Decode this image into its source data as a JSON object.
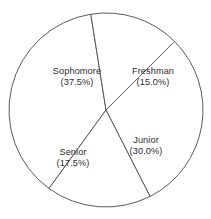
{
  "chart_data": {
    "type": "pie",
    "title": "",
    "subtitle": "",
    "xlabel": "",
    "ylabel": "",
    "legend": "none",
    "grid": false,
    "labels_inside": true,
    "categories": [
      "Sophomore",
      "Freshman",
      "Junior",
      "Senior"
    ],
    "values": [
      37.5,
      15.0,
      30.0,
      17.5
    ],
    "units": "percent",
    "total": 100.0,
    "slices": [
      {
        "name": "Sophomore",
        "value": 37.5,
        "percent_text": "(37.5%)",
        "label_line1": "Sophomore",
        "label_line2": "(37.5%)",
        "start_angle_deg": 99,
        "end_angle_deg": 234,
        "sweep_deg": 135,
        "label_x": 77,
        "label_y": 77
      },
      {
        "name": "Freshman",
        "value": 15.0,
        "percent_text": "(15.0%)",
        "label_line1": "Freshman",
        "label_line2": "(15.0%)",
        "start_angle_deg": 45,
        "end_angle_deg": 99,
        "sweep_deg": 54,
        "label_x": 153,
        "label_y": 77
      },
      {
        "name": "Junior",
        "value": 30.0,
        "percent_text": "(30.0%)",
        "label_line1": "Junior",
        "label_line2": "(30.0%)",
        "start_angle_deg": -63,
        "end_angle_deg": 45,
        "sweep_deg": 108,
        "label_x": 146,
        "label_y": 146
      },
      {
        "name": "Senior",
        "value": 17.5,
        "percent_text": "(17.5%)",
        "label_line1": "Senior",
        "label_line2": "(17.5%)",
        "start_angle_deg": -126,
        "end_angle_deg": -63,
        "sweep_deg": 63,
        "label_x": 73,
        "label_y": 158
      }
    ],
    "geometry": {
      "center_x": 106,
      "center_y": 110,
      "radius": 97
    },
    "style": {
      "background": "#ffffff",
      "slice_fill": "#ffffff",
      "outline_color": "#5a5a5a",
      "outline_width": 1,
      "label_color": "#2b2b2b"
    }
  }
}
